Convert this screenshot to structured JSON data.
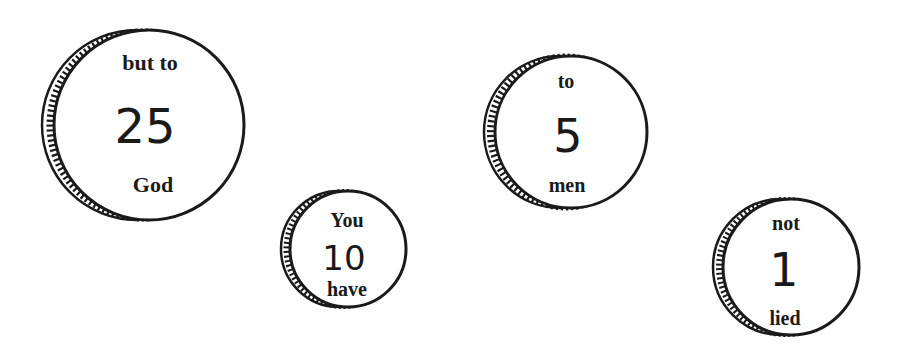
{
  "scene": {
    "background": "#ffffff",
    "ink": "#1a1a1a"
  },
  "coins": [
    {
      "id": "coin-25",
      "top_word": "but to",
      "value": "25",
      "bottom_word": "God",
      "cx": 149,
      "cy": 125,
      "r": 95,
      "rim_offset": 12,
      "top_size": 22,
      "num_size": 48,
      "bottom_size": 22,
      "top_y": 70,
      "num_y": 143,
      "bottom_y": 192
    },
    {
      "id": "coin-10",
      "top_word": "You",
      "value": "10",
      "bottom_word": "have",
      "cx": 348,
      "cy": 249,
      "r": 58,
      "rim_offset": 9,
      "top_size": 20,
      "num_size": 36,
      "bottom_size": 20,
      "top_y": 227,
      "num_y": 270,
      "bottom_y": 296
    },
    {
      "id": "coin-5",
      "top_word": "to",
      "value": "5",
      "bottom_word": "men",
      "cx": 571,
      "cy": 132,
      "r": 76,
      "rim_offset": 11,
      "top_size": 20,
      "num_size": 46,
      "bottom_size": 20,
      "top_y": 88,
      "num_y": 152,
      "bottom_y": 192
    },
    {
      "id": "coin-1",
      "top_word": "not",
      "value": "1",
      "bottom_word": "lied",
      "cx": 791,
      "cy": 267,
      "r": 68,
      "rim_offset": 10,
      "top_size": 20,
      "num_size": 46,
      "bottom_size": 20,
      "top_y": 230,
      "num_y": 286,
      "bottom_y": 325
    }
  ]
}
